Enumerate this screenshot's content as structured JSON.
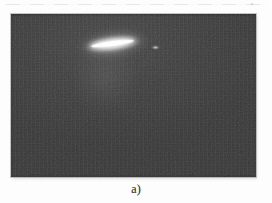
{
  "figure": {
    "caption_label": "a)",
    "content": "dark photograph with a bright horizontal light streak and a small secondary glow spot",
    "colors": {
      "page_background": "#ffffff",
      "photo_background": "#3a3a3a",
      "streak_core": "#ffffff",
      "secondary_spot": "#d7d7d7",
      "caption_text": "#3b3b3b"
    }
  }
}
